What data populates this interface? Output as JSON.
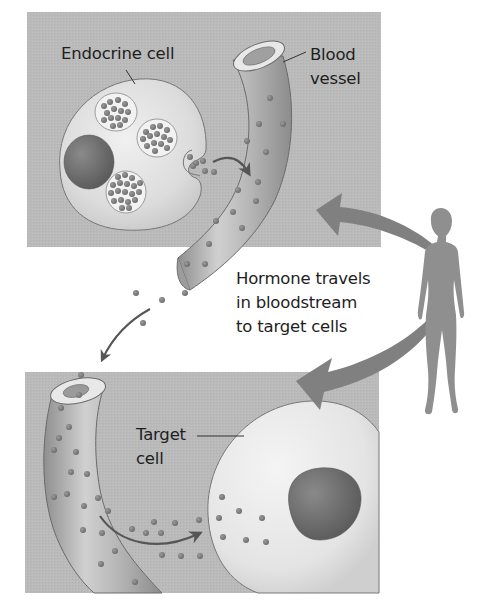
{
  "figure": {
    "colors": {
      "panel_bg": "#b9b9b9",
      "cell_fill": "#e2e2e2",
      "nucleus": "#6e6e6e",
      "vessel": "#a9a9a9",
      "hormone_dot": "#7a7a7a",
      "big_arrow": "#808080",
      "person": "#8f8f8f",
      "text": "#1e1e1e"
    }
  },
  "top_panel": {
    "endocrine_label": "Endocrine cell",
    "blood_label_line1": "Blood",
    "blood_label_line2": "vessel"
  },
  "middle": {
    "caption_line1": "Hormone travels",
    "caption_line2": "in bloodstream",
    "caption_line3": "to target cells"
  },
  "bottom_panel": {
    "target_label_line1": "Target",
    "target_label_line2": "cell"
  },
  "icons": {
    "person": "human-silhouette",
    "arrows": [
      "secretion-arrow",
      "travel-arrow",
      "uptake-arrow",
      "zoom-arrow-top",
      "zoom-arrow-bottom"
    ]
  }
}
